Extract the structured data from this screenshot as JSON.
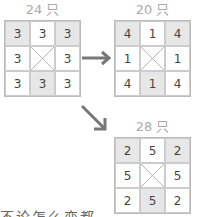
{
  "diagrams": [
    {
      "label": "24 只",
      "cells": [
        "3",
        "3",
        "3",
        "3",
        "",
        "3",
        "3",
        "3",
        "3"
      ],
      "shaded": [
        0,
        2,
        7
      ]
    },
    {
      "label": "20 只",
      "cells": [
        "4",
        "1",
        "4",
        "1",
        "",
        "1",
        "4",
        "1",
        "4"
      ],
      "shaded": [
        0,
        2,
        7
      ]
    },
    {
      "label": "28 只",
      "cells": [
        "2",
        "5",
        "2",
        "5",
        "",
        "5",
        "2",
        "5",
        "2"
      ],
      "shaded": [
        0,
        2,
        7
      ]
    }
  ],
  "arrows": [
    {
      "name": "right-arrow",
      "color": "#777777"
    },
    {
      "name": "diagonal-arrow",
      "color": "#777777"
    }
  ],
  "caption": "不论怎么变都"
}
